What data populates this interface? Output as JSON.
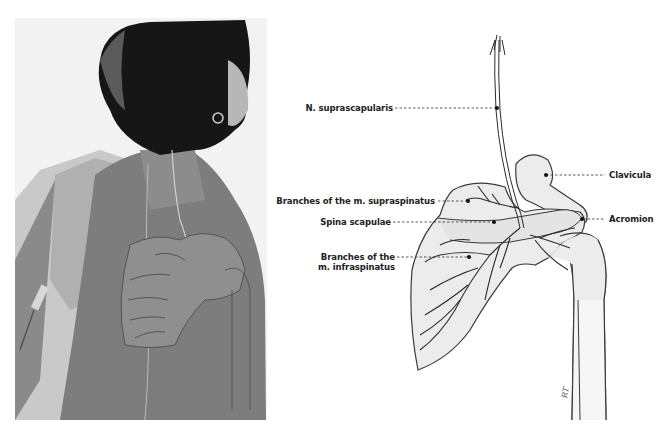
{
  "figure": {
    "left_panel": {
      "type": "photograph",
      "subject": "back view of woman with short hair, shoulder drape, needle electrode, overlay of scapula and nerve drawing"
    },
    "right_panel": {
      "type": "anatomical illustration",
      "subject": "right scapula, clavicula, humerus, suprascapular nerve and branches"
    },
    "labels": {
      "n_suprascapularis": "N. suprascapularis",
      "branches_supraspinatus": "Branches of the m. supraspinatus",
      "spina_scapulae": "Spina scapulae",
      "branches_infraspinatus_line1": "Branches of the",
      "branches_infraspinatus_line2": "m. infraspinatus",
      "clavicula": "Clavicula",
      "acromion": "Acromion"
    },
    "signature": "RT",
    "colors": {
      "bone_fill": "#ececec",
      "bone_stroke": "#3a3a3a",
      "nerve_stroke": "#2a2a2a",
      "leader_line": "#333333",
      "skin": "#7d7d7d",
      "hair": "#1a1a1a",
      "drape": "#b5b5b5"
    }
  }
}
